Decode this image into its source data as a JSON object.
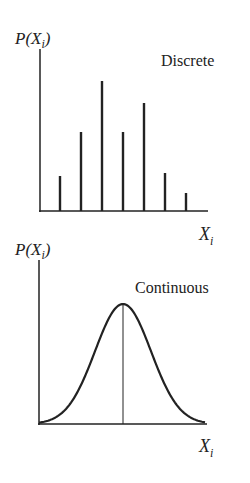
{
  "chart_data": [
    {
      "type": "bar",
      "title": "Discrete",
      "xlabel": "X_i",
      "ylabel": "P(X_i)",
      "categories": [
        "x1",
        "x2",
        "x3",
        "x4",
        "x5",
        "x6",
        "x7"
      ],
      "values": [
        35,
        79,
        130,
        79,
        108,
        38,
        18
      ],
      "grid": false,
      "style": "spike/stem lines"
    },
    {
      "type": "line",
      "title": "Continuous",
      "xlabel": "X_i",
      "ylabel": "P(X_i)",
      "shape": "normal bell curve",
      "peak_marker": "vertical line at mean",
      "grid": false
    }
  ],
  "discrete": {
    "ylabel_main": "P(X",
    "ylabel_sub": "i",
    "ylabel_close": ")",
    "title": "Discrete",
    "xlabel_main": "X",
    "xlabel_sub": "i"
  },
  "continuous": {
    "ylabel_main": "P(X",
    "ylabel_sub": "i",
    "ylabel_close": ")",
    "title": "Continuous",
    "xlabel_main": "X",
    "xlabel_sub": "i"
  }
}
